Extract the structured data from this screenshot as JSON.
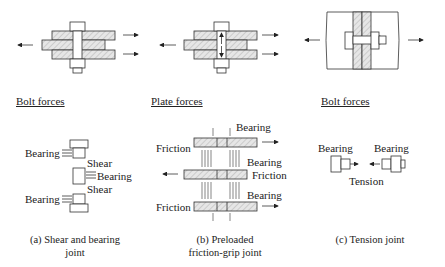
{
  "headers": {
    "a": "Bolt forces",
    "b": "Plate forces",
    "c": "Bolt forces"
  },
  "panel_a": {
    "labels": [
      "Bearing",
      "Shear",
      "Bearing",
      "Shear",
      "Bearing"
    ],
    "caption_line1": "(a) Shear and bearing",
    "caption_line2": "joint"
  },
  "panel_b": {
    "labels": {
      "bearing_top": "Bearing",
      "friction_top": "Friction",
      "bearing_mid": "Bearing",
      "friction_mid": "Friction",
      "bearing_bot": "Bearing",
      "friction_bot": "Friction"
    },
    "caption_line1": "(b) Preloaded",
    "caption_line2": "friction-grip joint"
  },
  "panel_c": {
    "labels": {
      "bearing_left": "Bearing",
      "bearing_right": "Bearing",
      "tension": "Tension"
    },
    "caption": "(c) Tension joint"
  },
  "colors": {
    "line": "#333333",
    "hatch_fill": "#e0e0e0"
  }
}
